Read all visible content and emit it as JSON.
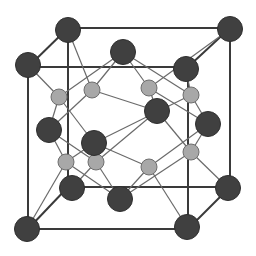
{
  "diagram": {
    "title": "",
    "type": "crystal-unit-cell",
    "colors": {
      "background": "#ffffff",
      "cube_edge": "#3a3a3a",
      "bond": "#6a6a6a",
      "large_atom_fill": "#404040",
      "small_atom_fill": "#a8a8a8"
    },
    "back_cube": {
      "tl": [
        68,
        28
      ],
      "tr": [
        230,
        28
      ],
      "bl": [
        68,
        187
      ],
      "br": [
        230,
        187
      ]
    },
    "front_cube": {
      "tl": [
        28,
        67
      ],
      "tr": [
        188,
        67
      ],
      "bl": [
        28,
        229
      ],
      "br": [
        188,
        229
      ]
    },
    "large_atoms": [
      {
        "id": "c-btl",
        "x": 68,
        "y": 30,
        "r": 12.5
      },
      {
        "id": "c-btr",
        "x": 230,
        "y": 29,
        "r": 12.5
      },
      {
        "id": "c-ftl",
        "x": 28,
        "y": 65,
        "r": 12.5
      },
      {
        "id": "c-ftr",
        "x": 186,
        "y": 69,
        "r": 12.5
      },
      {
        "id": "c-bbl",
        "x": 72,
        "y": 188,
        "r": 12.5
      },
      {
        "id": "c-bbr",
        "x": 228,
        "y": 188,
        "r": 12.5
      },
      {
        "id": "c-fbl",
        "x": 27,
        "y": 229,
        "r": 12.5
      },
      {
        "id": "c-fbr",
        "x": 187,
        "y": 227,
        "r": 12.5
      },
      {
        "id": "f-top",
        "x": 123,
        "y": 52,
        "r": 12.5
      },
      {
        "id": "f-back",
        "x": 157,
        "y": 111,
        "r": 12.5
      },
      {
        "id": "f-left",
        "x": 49,
        "y": 130,
        "r": 12.5
      },
      {
        "id": "f-right",
        "x": 208,
        "y": 124,
        "r": 12.5
      },
      {
        "id": "f-front",
        "x": 94,
        "y": 143,
        "r": 12.5
      },
      {
        "id": "f-bottom",
        "x": 120,
        "y": 199,
        "r": 12.5
      }
    ],
    "small_atoms": [
      {
        "id": "t1",
        "x": 59,
        "y": 97,
        "r": 8,
        "bonds": [
          "c-ftl",
          "f-top",
          "f-left",
          "f-front"
        ]
      },
      {
        "id": "t2",
        "x": 92,
        "y": 90,
        "r": 8,
        "bonds": [
          "c-btl",
          "f-top",
          "f-left",
          "f-back"
        ]
      },
      {
        "id": "t3",
        "x": 149,
        "y": 88,
        "r": 8,
        "bonds": [
          "c-btr",
          "f-top",
          "f-right",
          "f-back"
        ]
      },
      {
        "id": "t4",
        "x": 191,
        "y": 95,
        "r": 8,
        "bonds": [
          "c-ftr",
          "f-top",
          "f-right",
          "f-front"
        ]
      },
      {
        "id": "t5",
        "x": 66,
        "y": 162,
        "r": 8,
        "bonds": [
          "c-fbl",
          "f-left",
          "f-front",
          "f-bottom"
        ]
      },
      {
        "id": "t6",
        "x": 96,
        "y": 162,
        "r": 8,
        "bonds": [
          "c-bbl",
          "f-left",
          "f-back",
          "f-bottom"
        ]
      },
      {
        "id": "t7",
        "x": 149,
        "y": 167,
        "r": 8,
        "bonds": [
          "c-fbr",
          "f-right",
          "f-front",
          "f-bottom"
        ]
      },
      {
        "id": "t8",
        "x": 191,
        "y": 152,
        "r": 8,
        "bonds": [
          "c-bbr",
          "f-right",
          "f-back",
          "f-bottom"
        ]
      }
    ]
  }
}
